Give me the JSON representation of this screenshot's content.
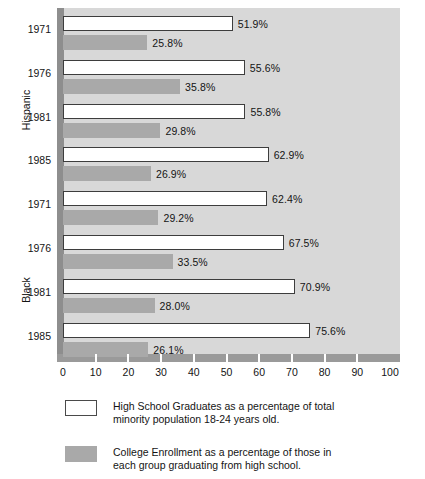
{
  "chart_data": {
    "type": "bar",
    "orientation": "horizontal",
    "title": "",
    "xlabel": "",
    "ylabel": "",
    "xlim": [
      0,
      100
    ],
    "xticks": [
      0,
      10,
      20,
      30,
      40,
      50,
      60,
      70,
      80,
      90,
      100
    ],
    "grid": false,
    "legend_position": "bottom-left",
    "group_labels": [
      "Hispanic",
      "Black"
    ],
    "categories": [
      "1971",
      "1976",
      "1981",
      "1985",
      "1971",
      "1976",
      "1981",
      "1985"
    ],
    "series": [
      {
        "name": "High School Graduates as a percentage of total minority population 18-24 years old.",
        "color": "#ffffff",
        "values": [
          51.9,
          55.6,
          55.8,
          62.9,
          62.4,
          67.5,
          70.9,
          75.6
        ],
        "labels": [
          "51.9%",
          "55.6%",
          "55.8%",
          "62.9%",
          "62.4%",
          "67.5%",
          "70.9%",
          "75.6%"
        ]
      },
      {
        "name": "College Enrollment as a percentage of those in each group graduating from high school.",
        "color": "#a9a9a9",
        "values": [
          25.8,
          35.8,
          29.8,
          26.9,
          29.2,
          33.5,
          28.0,
          26.1
        ],
        "labels": [
          "25.8%",
          "35.8%",
          "29.8%",
          "26.9%",
          "29.2%",
          "33.5%",
          "28.0%",
          "26.1%"
        ]
      }
    ],
    "groups": [
      {
        "label": "Hispanic",
        "rows": [
          {
            "year": "1971",
            "hs": 51.9,
            "hs_label": "51.9%",
            "col": 25.8,
            "col_label": "25.8%"
          },
          {
            "year": "1976",
            "hs": 55.6,
            "hs_label": "55.6%",
            "col": 35.8,
            "col_label": "35.8%"
          },
          {
            "year": "1981",
            "hs": 55.8,
            "hs_label": "55.8%",
            "col": 29.8,
            "col_label": "29.8%"
          },
          {
            "year": "1985",
            "hs": 62.9,
            "hs_label": "62.9%",
            "col": 26.9,
            "col_label": "26.9%"
          }
        ]
      },
      {
        "label": "Black",
        "rows": [
          {
            "year": "1971",
            "hs": 62.4,
            "hs_label": "62.4%",
            "col": 29.2,
            "col_label": "29.2%"
          },
          {
            "year": "1976",
            "hs": 67.5,
            "hs_label": "67.5%",
            "col": 33.5,
            "col_label": "33.5%"
          },
          {
            "year": "1981",
            "hs": 70.9,
            "hs_label": "70.9%",
            "col": 28.0,
            "col_label": "28.0%"
          },
          {
            "year": "1985",
            "hs": 75.6,
            "hs_label": "75.6%",
            "col": 26.1,
            "col_label": "26.1%"
          }
        ]
      }
    ]
  },
  "axis": {
    "x_tick_labels": [
      "0",
      "10",
      "20",
      "30",
      "40",
      "50",
      "60",
      "70",
      "80",
      "90",
      "100"
    ],
    "y_tick_labels": [
      "1971",
      "1976",
      "1981",
      "1985",
      "1971",
      "1976",
      "1981",
      "1985"
    ],
    "group_label_top": "Hispanic",
    "group_label_bottom": "Black"
  },
  "legend": {
    "items": [
      {
        "swatch": "white",
        "line1": "High School Graduates as a percentage of total",
        "line2": "minority population 18-24 years old."
      },
      {
        "swatch": "gray",
        "line1": "College Enrollment as a percentage of those in",
        "line2": "each group graduating from high school."
      }
    ]
  },
  "colors": {
    "plot_background": "#d8d8d8",
    "axis_band": "#8e8e8e",
    "bar_high_school": "#ffffff",
    "bar_college": "#a9a9a9",
    "text": "#141414"
  }
}
